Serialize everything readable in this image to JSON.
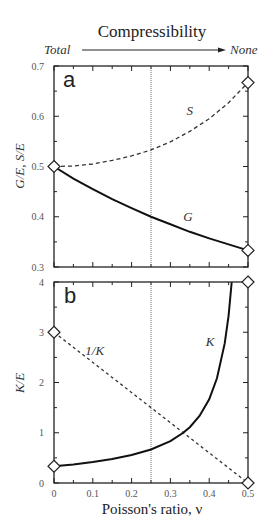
{
  "header": {
    "title": "Compressibility",
    "left_label": "Total",
    "right_label": "None"
  },
  "colors": {
    "axis": "#222222",
    "curve": "#111111",
    "dashed": "#333333",
    "guide": "#555555",
    "marker_fill": "#ffffff"
  },
  "chart_data": [
    {
      "panel": "a",
      "type": "line",
      "title": "",
      "xlabel": "Poisson's ratio, ν",
      "ylabel": "G/E, S/E",
      "xlim": [
        0,
        0.5
      ],
      "ylim": [
        0.3,
        0.7
      ],
      "x_ticks": [
        0,
        0.1,
        0.2,
        0.3,
        0.4,
        0.5
      ],
      "y_ticks": [
        0.3,
        0.4,
        0.5,
        0.6,
        0.7
      ],
      "y_tick_labels": [
        "0.3",
        "0.4",
        "0.5",
        "0.6",
        "0.7"
      ],
      "grid": false,
      "vertical_guide_x": 0.25,
      "series": [
        {
          "name": "S",
          "style": "dashed",
          "formula": "1/(2(1-ν²))",
          "x": [
            0,
            0.05,
            0.1,
            0.15,
            0.2,
            0.25,
            0.3,
            0.35,
            0.4,
            0.45,
            0.5
          ],
          "values": [
            0.5,
            0.501,
            0.505,
            0.512,
            0.521,
            0.533,
            0.549,
            0.57,
            0.595,
            0.627,
            0.667
          ],
          "label_pos": [
            0.35,
            0.61
          ]
        },
        {
          "name": "G",
          "style": "solid",
          "formula": "1/(2(1+ν))",
          "x": [
            0,
            0.05,
            0.1,
            0.15,
            0.2,
            0.25,
            0.3,
            0.35,
            0.4,
            0.45,
            0.5
          ],
          "values": [
            0.5,
            0.476,
            0.455,
            0.435,
            0.417,
            0.4,
            0.385,
            0.37,
            0.357,
            0.345,
            0.333
          ],
          "label_pos": [
            0.345,
            0.4
          ]
        }
      ],
      "markers": [
        {
          "x": 0,
          "y": 0.5
        },
        {
          "x": 0.5,
          "y": 0.667
        },
        {
          "x": 0.5,
          "y": 0.333
        }
      ]
    },
    {
      "panel": "b",
      "type": "line",
      "title": "",
      "xlabel": "Poisson's ratio, ν",
      "ylabel": "K/E",
      "xlim": [
        0,
        0.5
      ],
      "ylim": [
        0,
        4
      ],
      "x_ticks": [
        0,
        0.1,
        0.2,
        0.3,
        0.4,
        0.5
      ],
      "x_tick_labels": [
        "0",
        "0.1",
        "0.2",
        "0.3",
        "0.4",
        "0.5"
      ],
      "y_ticks": [
        0,
        1,
        2,
        3,
        4
      ],
      "y_tick_labels": [
        "0",
        "1",
        "2",
        "3",
        "4"
      ],
      "grid": false,
      "vertical_guide_x": 0.25,
      "series": [
        {
          "name": "1/K",
          "style": "dashed",
          "formula": "3(1-2ν)",
          "x": [
            0,
            0.5
          ],
          "values": [
            3,
            0
          ],
          "label_pos": [
            0.105,
            2.62
          ]
        },
        {
          "name": "K",
          "style": "solid",
          "formula": "1/(3(1-2ν))",
          "x": [
            0,
            0.05,
            0.1,
            0.15,
            0.2,
            0.25,
            0.3,
            0.333,
            0.35,
            0.375,
            0.4,
            0.42,
            0.44,
            0.45,
            0.458
          ],
          "values": [
            0.333,
            0.37,
            0.417,
            0.476,
            0.556,
            0.667,
            0.833,
            1.0,
            1.111,
            1.333,
            1.667,
            2.083,
            2.778,
            3.333,
            4.0
          ],
          "label_pos": [
            0.402,
            2.8
          ]
        }
      ],
      "markers": [
        {
          "x": 0,
          "y": 3
        },
        {
          "x": 0,
          "y": 0.333
        },
        {
          "x": 0.5,
          "y": 4
        },
        {
          "x": 0.5,
          "y": 0
        }
      ]
    }
  ],
  "layout": {
    "plot_left": 54,
    "plot_right": 248,
    "panels": [
      {
        "top": 66,
        "bottom": 267
      },
      {
        "top": 282,
        "bottom": 483
      }
    ]
  }
}
